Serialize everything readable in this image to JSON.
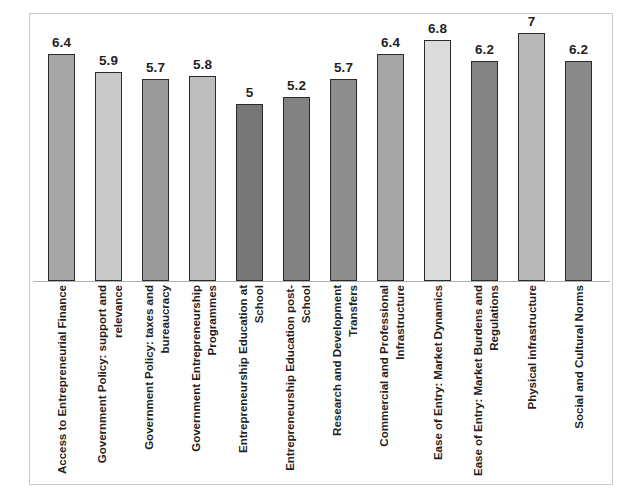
{
  "chart_data": {
    "type": "bar",
    "title": "",
    "subtitle": "",
    "xlabel": "",
    "ylabel": "",
    "ylim": [
      0,
      7
    ],
    "grid": false,
    "legend": "none",
    "axis": {
      "y_ticks_visible": false,
      "x_tick_labels_rotation_degrees": 90,
      "baseline_visible": true
    },
    "categories": [
      "Access to Entrepreneurial Finance",
      "Government Policy: support and relevance",
      "Government Policy: taxes and bureaucracy",
      "Government Entrepreneurship Programmes",
      "Entrepreneurship Education at School",
      "Entrepreneurship Education post-School",
      "Research and Development Transfers",
      "Commercial and Professional Infrastructure",
      "Ease of Entry: Market Dynamics",
      "Ease of Entry: Market Burdens and Regulations",
      "Physical infrastructure",
      "Social and Cultural Norms"
    ],
    "values": [
      6.4,
      5.9,
      5.7,
      5.8,
      5,
      5.2,
      5.7,
      6.4,
      6.8,
      6.2,
      7,
      6.2
    ],
    "value_labels": [
      "6.4",
      "5.9",
      "5.7",
      "5.8",
      "5",
      "5.2",
      "5.7",
      "6.4",
      "6.8",
      "6.2",
      "7",
      "6.2"
    ],
    "bar_colors": [
      "#A6A6A6",
      "#C9C9C9",
      "#9A9A9A",
      "#BDBDBD",
      "#777777",
      "#828282",
      "#8E8E8E",
      "#A6A6A6",
      "#DCDCDC",
      "#848484",
      "#B8B8B8",
      "#8A8A8A"
    ],
    "bar_border_color": "#2B2B2B",
    "frame_color": "#C9C9C9",
    "baseline_color": "#B0B0B0",
    "background_color": "#FFFFFF",
    "text_color": "#1F1F1F"
  }
}
